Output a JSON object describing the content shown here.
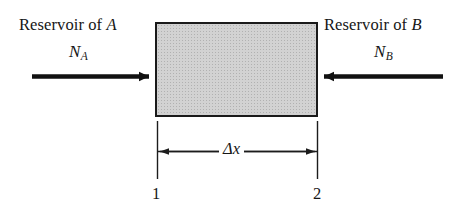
{
  "figure": {
    "type": "diagram",
    "background_color": "#ffffff",
    "ink_color": "#1a1a1a"
  },
  "left_reservoir": {
    "title_prefix": "Reservoir of ",
    "title_species": "A",
    "flux_symbol": "N",
    "flux_subscript": "A",
    "arrow_direction": "right"
  },
  "right_reservoir": {
    "title_prefix": "Reservoir of ",
    "title_species": "B",
    "flux_symbol": "N",
    "flux_subscript": "B",
    "arrow_direction": "left"
  },
  "control_volume": {
    "fill_color": "#d2d2d2",
    "border_color": "#1a1a1a"
  },
  "dimension": {
    "label": "Δx",
    "left_endpoint": "1",
    "right_endpoint": "2"
  }
}
